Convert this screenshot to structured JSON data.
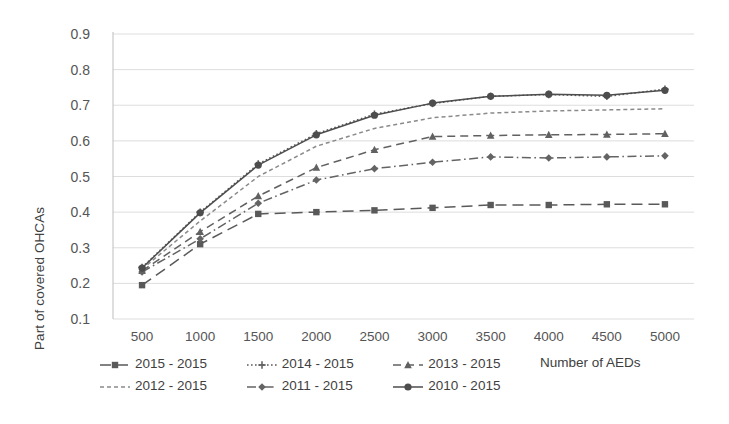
{
  "chart_data": {
    "type": "line",
    "title": "",
    "xlabel": "Number of AEDs",
    "ylabel": "Part of covered OHCAs",
    "x": [
      500,
      1000,
      1500,
      2000,
      2500,
      3000,
      3500,
      4000,
      4500,
      5000
    ],
    "xticklabels": [
      "500",
      "1000",
      "1500",
      "2000",
      "2500",
      "3000",
      "3500",
      "4000",
      "4500",
      "5000"
    ],
    "yticklabels": [
      "0.9",
      "0.8",
      "0.7",
      "0.6",
      "0.5",
      "0.4",
      "0.3",
      "0.2",
      "0.1"
    ],
    "ylim": [
      0.1,
      0.9
    ],
    "ytick_step": 0.1,
    "grid": "horizontal",
    "legend_position": "bottom",
    "series": [
      {
        "name": "2015 - 2015",
        "marker": "square",
        "dash": "long-dash",
        "color": "#595959",
        "values": [
          0.195,
          0.31,
          0.395,
          0.4,
          0.405,
          0.412,
          0.42,
          0.42,
          0.422,
          0.422
        ]
      },
      {
        "name": "2014 - 2015",
        "marker": "plus",
        "dash": "dotted",
        "color": "#5a5a5a",
        "values": [
          0.245,
          0.4,
          0.535,
          0.62,
          0.675,
          0.705,
          0.725,
          0.73,
          0.725,
          0.745
        ]
      },
      {
        "name": "2013 - 2015",
        "marker": "triangle",
        "dash": "dash",
        "color": "#616161",
        "values": [
          0.235,
          0.345,
          0.445,
          0.525,
          0.575,
          0.612,
          0.615,
          0.617,
          0.618,
          0.62
        ]
      },
      {
        "name": "2012 - 2015",
        "marker": "none",
        "dash": "short-dash",
        "color": "#8a8a8a",
        "values": [
          0.24,
          0.375,
          0.5,
          0.585,
          0.635,
          0.665,
          0.678,
          0.684,
          0.687,
          0.69
        ]
      },
      {
        "name": "2011 - 2015",
        "marker": "diamond",
        "dash": "dash-dot",
        "color": "#646464",
        "values": [
          0.232,
          0.325,
          0.425,
          0.49,
          0.522,
          0.54,
          0.555,
          0.552,
          0.555,
          0.558
        ]
      },
      {
        "name": "2010 - 2015",
        "marker": "circle",
        "dash": "solid",
        "color": "#4d4d4d",
        "values": [
          0.243,
          0.398,
          0.532,
          0.617,
          0.672,
          0.706,
          0.725,
          0.731,
          0.728,
          0.742
        ]
      }
    ]
  },
  "legend": {
    "row1": [
      "2015 - 2015",
      "2014 - 2015",
      "2013 - 2015"
    ],
    "row2": [
      "2012 - 2015",
      "2011 - 2015",
      "2010 - 2015"
    ]
  },
  "axes": {
    "x_title": "Number of AEDs",
    "y_title": "Part of covered OHCAs"
  }
}
